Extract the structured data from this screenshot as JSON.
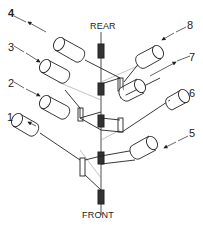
{
  "diagram": {
    "axis_labels": {
      "top": "REAR",
      "bottom": "FRONT"
    },
    "callouts": [
      {
        "id": "1",
        "label": "1",
        "arrow": "in"
      },
      {
        "id": "2",
        "label": "2",
        "arrow": "in"
      },
      {
        "id": "3",
        "label": "3",
        "arrow": "in"
      },
      {
        "id": "4",
        "label": "4",
        "arrow": "out"
      },
      {
        "id": "5",
        "label": "5",
        "arrow": "in"
      },
      {
        "id": "6",
        "label": "6",
        "arrow": "out"
      },
      {
        "id": "7",
        "label": "7",
        "arrow": "out"
      },
      {
        "id": "8",
        "label": "8",
        "arrow": "in"
      }
    ],
    "colors": {
      "line": "#222222",
      "faint": "#999999",
      "background": "#ffffff"
    }
  }
}
